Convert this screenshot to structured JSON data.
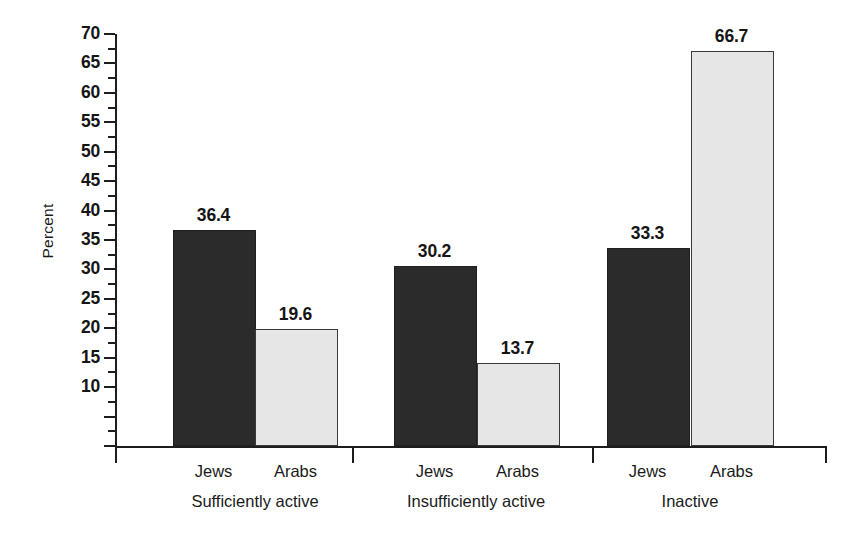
{
  "chart_data": {
    "type": "bar",
    "title": "",
    "xlabel": "",
    "ylabel": "Percent",
    "ylim": [
      0,
      70
    ],
    "ytick_step": 5,
    "yminor_step": 2.5,
    "grid": false,
    "legend": "none",
    "categories": [
      "Sufficiently active",
      "Insufficiently active",
      "Inactive"
    ],
    "series": [
      {
        "name": "Jews",
        "color": "#2b2b2b",
        "values": [
          36.4,
          30.2,
          33.3
        ]
      },
      {
        "name": "Arabs",
        "color": "#e6e6e6",
        "values": [
          19.6,
          13.7,
          66.7
        ]
      }
    ],
    "ytick_labels": [
      "70",
      "65",
      "60",
      "55",
      "50",
      "45",
      "40",
      "35",
      "30",
      "25",
      "20",
      "15",
      "10"
    ],
    "ytick_values": [
      70,
      65,
      60,
      55,
      50,
      45,
      40,
      35,
      30,
      25,
      20,
      15,
      10
    ],
    "data_labels": [
      "36.4",
      "19.6",
      "30.2",
      "13.7",
      "33.3",
      "66.7"
    ]
  },
  "axes": {
    "y_title": "Percent"
  },
  "groups": [
    {
      "label": "Sufficiently active",
      "bars": [
        {
          "series": "Jews",
          "value": 36.4,
          "label": "36.4",
          "style": "dark"
        },
        {
          "series": "Arabs",
          "value": 19.6,
          "label": "19.6",
          "style": "light"
        }
      ]
    },
    {
      "label": "Insufficiently active",
      "bars": [
        {
          "series": "Jews",
          "value": 30.2,
          "label": "30.2",
          "style": "dark"
        },
        {
          "series": "Arabs",
          "value": 13.7,
          "label": "13.7",
          "style": "light"
        }
      ]
    },
    {
      "label": "Inactive",
      "bars": [
        {
          "series": "Jews",
          "value": 33.3,
          "label": "33.3",
          "style": "dark"
        },
        {
          "series": "Arabs",
          "value": 66.7,
          "label": "66.7",
          "style": "light"
        }
      ]
    }
  ],
  "colors": {
    "dark_bar": "#2b2b2b",
    "light_bar": "#e6e6e6",
    "axis": "#1d1d1d",
    "text": "#151515",
    "background": "#ffffff"
  }
}
